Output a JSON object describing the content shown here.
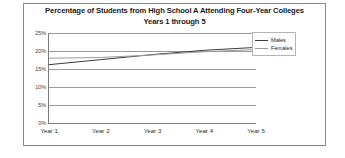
{
  "chart_data": {
    "type": "line",
    "title": "Percentage of Students from High School A Attending Four-Year Colleges",
    "subtitle": "Years 1 through 5",
    "title_lines": [
      "Percentage of Students from High School A Attending Four-Year Colleges",
      "Years 1 through 5"
    ],
    "xlabel": "",
    "ylabel": "",
    "categories": [
      "Year 1",
      "Year 2",
      "Year 3",
      "Year 4",
      "Year 5"
    ],
    "ylim": [
      0,
      25
    ],
    "yticks": [
      0,
      5,
      10,
      15,
      20,
      25
    ],
    "ytick_labels": [
      "0%",
      "5%",
      "10%",
      "15%",
      "20%",
      "25%"
    ],
    "grid": true,
    "legend_position": "right",
    "series": [
      {
        "name": "Males",
        "color": "#3c3c3c",
        "values": [
          16.2,
          17.6,
          19.0,
          20.2,
          21.0
        ]
      },
      {
        "name": "Females",
        "color": "#9b9b9b",
        "values": [
          18.0,
          18.2,
          18.9,
          19.8,
          20.4
        ]
      }
    ]
  },
  "legend": {
    "items": [
      {
        "label": "Males"
      },
      {
        "label": "Females"
      }
    ]
  },
  "colors": {
    "males_line": "#3c3c3c",
    "females_line": "#9b9b9b",
    "axis": "#7d7d7d",
    "gridline": "#9a9a9a",
    "frame": "#8a8a8a",
    "title_text": "#1a1a1a",
    "background": "#ffffff"
  }
}
